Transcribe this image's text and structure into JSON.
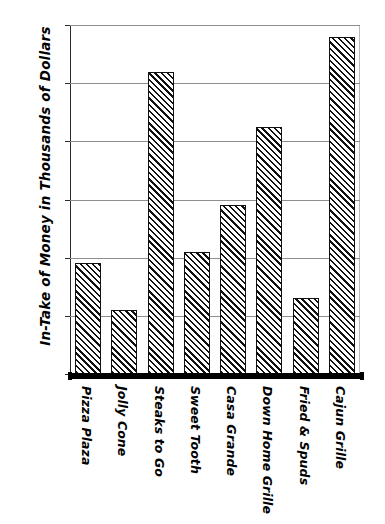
{
  "chart_data": {
    "type": "bar",
    "title": "",
    "xlabel": "",
    "ylabel": "In-Take of Money in Thousands of Dollars",
    "ylim": [
      0,
      120
    ],
    "yticks": [
      "0",
      "20",
      "40",
      "60",
      "80",
      "100",
      "120"
    ],
    "ytick_values": [
      0,
      20,
      40,
      60,
      80,
      100,
      120
    ],
    "grid": true,
    "legend": "none",
    "bar_fill": "diagonal-hatch",
    "categories": [
      "Pizza Plaza",
      "Jolly Cone",
      "Steaks to Go",
      "Sweet Tooth",
      "Casa Grande",
      "Down Home Grille",
      "Fried & Spuds",
      "Cajun Grille"
    ],
    "values": [
      38,
      22,
      104,
      42,
      58,
      85,
      26,
      116
    ],
    "colors": {
      "bar_outline": "#111111",
      "bar_hatch": "#111111",
      "bar_background": "#ffffff",
      "gridline": "#8e8e8e",
      "axis": "#000000",
      "text": "#000000",
      "plot_background": "#ffffff"
    }
  }
}
